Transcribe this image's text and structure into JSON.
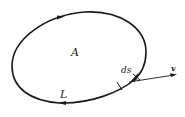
{
  "diagram": {
    "labels": {
      "area": "A",
      "curve": "L",
      "element": "ds",
      "vector": "v"
    },
    "colors": {
      "stroke": "#1a1a1a",
      "background": "#ffffff"
    },
    "orientation": "clockwise-in-image (arrow on top pointing right, arrow on bottom pointing left)"
  }
}
